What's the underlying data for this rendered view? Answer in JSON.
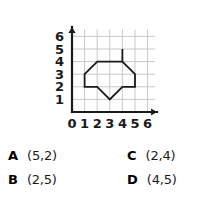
{
  "question": {
    "figure_caption": "",
    "choices": [
      {
        "letter": "A",
        "text": "(5,2)"
      },
      {
        "letter": "B",
        "text": "(2,5)"
      },
      {
        "letter": "C",
        "text": "(2,4)"
      },
      {
        "letter": "D",
        "text": "(4,5)"
      }
    ]
  },
  "chart_data": {
    "type": "scatter",
    "title": "",
    "xlabel": "",
    "ylabel": "",
    "xlim": [
      0,
      6
    ],
    "ylim": [
      0,
      6
    ],
    "grid": true,
    "legend": null,
    "x_ticks": [
      "0",
      "1",
      "2",
      "3",
      "4",
      "5",
      "6"
    ],
    "y_ticks": [
      "1",
      "2",
      "3",
      "4",
      "5",
      "6"
    ],
    "origin_label": "0",
    "shapes": [
      {
        "name": "plotted-polygon",
        "kind": "polyline",
        "closed": true,
        "stroke": "#1a1a1a",
        "fill": "none",
        "points": [
          [
            1,
            2
          ],
          [
            1,
            3
          ],
          [
            2,
            4
          ],
          [
            4,
            4
          ],
          [
            5,
            3
          ],
          [
            5,
            2
          ],
          [
            4,
            2
          ],
          [
            3,
            1
          ],
          [
            2,
            2
          ]
        ]
      },
      {
        "name": "vertical-spike",
        "kind": "polyline",
        "closed": false,
        "stroke": "#1a1a1a",
        "fill": "none",
        "points": [
          [
            4,
            5
          ],
          [
            4,
            4
          ]
        ]
      }
    ],
    "colors": {
      "axis": "#1a1a1a",
      "grid": "#c9c9c9",
      "shape_stroke": "#1a1a1a",
      "background": "#ffffff"
    }
  }
}
